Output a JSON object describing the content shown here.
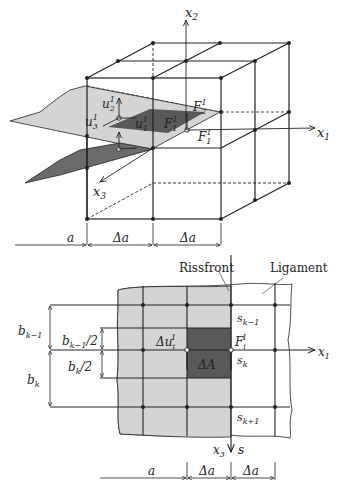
{
  "figure_top": {
    "axes": {
      "x1": "x",
      "x1_sub": "1",
      "x2": "x",
      "x2_sub": "2",
      "x3": "x",
      "x3_sub": "3"
    },
    "labels": {
      "u2": "u",
      "u2_sub": "2",
      "u2_sup": "1",
      "u3": "u",
      "u3_sub": "3",
      "u3_sup": "1",
      "u1": "u",
      "u1_sub": "1",
      "u1_sup": "1",
      "F2": "F",
      "F2_sub": "2",
      "F2_sup": "1",
      "F1a": "F",
      "F1a_sub": "1",
      "F1a_sup": "1",
      "F1b": "F",
      "F1b_sub": "1",
      "F1b_sup": "1"
    },
    "dimensions": {
      "a": "a",
      "da1": "Δa",
      "da2": "Δa"
    }
  },
  "figure_bottom": {
    "labels": {
      "rissfront": "Rissfront",
      "ligament": "Ligament",
      "bk_1": "b",
      "bk_1_sub": "k−1",
      "bk_1_half": "b",
      "bk_1_half_sub": "k−1",
      "bk_1_half_rest": "/2",
      "bk_half": "b",
      "bk_half_sub": "k",
      "bk_half_rest": "/2",
      "bk": "b",
      "bk_sub": "k",
      "du": "Δu",
      "du_sub": "i",
      "du_sup": "1",
      "Fi": "F",
      "Fi_sub": "i",
      "Fi_sup": "1",
      "dA": "ΔA",
      "sk_1": "s",
      "sk_1_sub": "k−1",
      "sk": "s",
      "sk_sub": "k",
      "sk1": "s",
      "sk1_sub": "k+1",
      "x1": "x",
      "x1_sub": "1",
      "x3": "x",
      "x3_sub": "3",
      "s": "s"
    },
    "dimensions": {
      "a": "a",
      "da1": "Δa",
      "da2": "Δa"
    }
  },
  "colors": {
    "light_gray": "#d4d4d4",
    "dark_gray": "#595959",
    "line": "#222222"
  }
}
